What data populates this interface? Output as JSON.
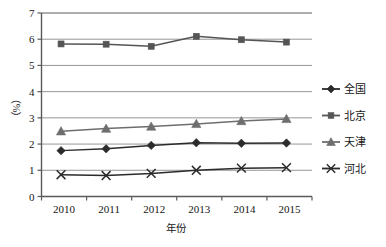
{
  "chart_data": {
    "type": "line",
    "title": "",
    "xlabel": "年份",
    "ylabel": "（%）",
    "x": [
      "2010",
      "2011",
      "2012",
      "2013",
      "2014",
      "2015"
    ],
    "categories": [
      "2010",
      "2011",
      "2012",
      "2013",
      "2014",
      "2015"
    ],
    "series": [
      {
        "name": "全国",
        "marker": "diamond",
        "color": "#2b2b2b",
        "values": [
          1.75,
          1.82,
          1.95,
          2.05,
          2.03,
          2.04
        ]
      },
      {
        "name": "北京",
        "marker": "square",
        "color": "#555555",
        "values": [
          5.82,
          5.81,
          5.73,
          6.11,
          5.98,
          5.89
        ]
      },
      {
        "name": "天津",
        "marker": "triangle",
        "color": "#6e6e6e",
        "values": [
          2.49,
          2.59,
          2.67,
          2.77,
          2.88,
          2.96
        ]
      },
      {
        "name": "河北",
        "marker": "cross",
        "color": "#2b2b2b",
        "values": [
          0.83,
          0.8,
          0.88,
          1.0,
          1.08,
          1.1
        ]
      }
    ],
    "ylim": [
      0,
      7
    ],
    "yticks": [
      "0",
      "1",
      "2",
      "3",
      "4",
      "5",
      "6",
      "7"
    ],
    "ytick_values": [
      0,
      1,
      2,
      3,
      4,
      5,
      6,
      7
    ],
    "grid": "horizontal",
    "legend_position": "right",
    "legend_entries": [
      "全国",
      "北京",
      "天津",
      "河北"
    ]
  },
  "axes": {
    "y_label": "（%）",
    "x_label": "年份"
  },
  "colors": {
    "axis": "#6a6a6a",
    "grid": "#8a8a8a",
    "text": "#161616",
    "plot_background": "#ffffff"
  }
}
